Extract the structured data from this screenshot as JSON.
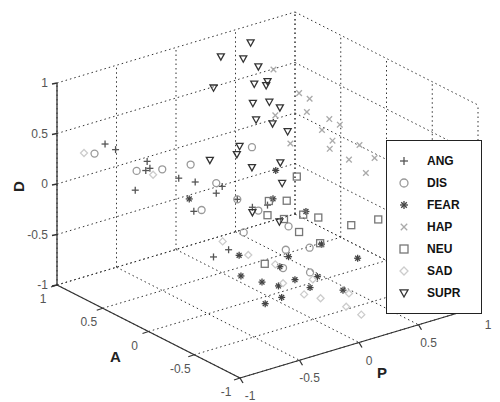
{
  "chart_data": {
    "type": "scatter",
    "dimensions": 3,
    "title": "",
    "xlabel": "P",
    "ylabel": "A",
    "zlabel": "D",
    "xlim": [
      -1,
      1
    ],
    "ylim": [
      -1,
      1
    ],
    "zlim": [
      -1,
      1
    ],
    "x_ticks": [
      "-1",
      "-0.5",
      "0",
      "0.5",
      "1"
    ],
    "y_ticks": [
      "1",
      "0.5",
      "0",
      "-0.5",
      "-1"
    ],
    "z_ticks": [
      "-1",
      "-0.5",
      "0",
      "0.5",
      "1"
    ],
    "grid": true,
    "legend_position": "right",
    "series": [
      {
        "name": "ANG",
        "marker": "plus",
        "color": "#555555",
        "points": [
          [
            -0.75,
            0.8,
            0.4
          ],
          [
            -0.7,
            0.75,
            0.35
          ],
          [
            -0.55,
            0.6,
            0.25
          ],
          [
            -0.6,
            0.55,
            0.2
          ],
          [
            -0.4,
            0.45,
            0.1
          ],
          [
            -0.3,
            0.4,
            0.05
          ],
          [
            -0.2,
            0.3,
            -0.05
          ],
          [
            -0.1,
            0.2,
            -0.1
          ],
          [
            -0.45,
            0.7,
            0.1
          ],
          [
            -0.65,
            0.6,
            0.0
          ],
          [
            -0.35,
            0.35,
            -0.2
          ],
          [
            -0.25,
            0.1,
            -0.5
          ],
          [
            -0.3,
            0.2,
            -0.6
          ],
          [
            -0.15,
            0.3,
            0.0
          ],
          [
            -0.05,
            0.1,
            -0.15
          ],
          [
            0.0,
            0.0,
            -0.1
          ]
        ]
      },
      {
        "name": "DIS",
        "marker": "circle",
        "color": "#999999",
        "points": [
          [
            -0.8,
            0.85,
            0.3
          ],
          [
            -0.6,
            0.65,
            0.15
          ],
          [
            -0.5,
            0.5,
            0.2
          ],
          [
            -0.3,
            0.45,
            0.2
          ],
          [
            -0.2,
            0.3,
            0.05
          ],
          [
            -0.1,
            0.2,
            -0.1
          ],
          [
            0.0,
            0.1,
            -0.2
          ],
          [
            0.1,
            -0.1,
            -0.3
          ],
          [
            -0.4,
            0.2,
            -0.1
          ],
          [
            -0.2,
            0.0,
            -0.3
          ],
          [
            0.0,
            -0.2,
            -0.45
          ],
          [
            0.2,
            -0.2,
            -0.5
          ],
          [
            -0.1,
            -0.3,
            -0.55
          ],
          [
            0.1,
            0.3,
            0.3
          ],
          [
            0.05,
            -0.4,
            -0.6
          ]
        ]
      },
      {
        "name": "FEAR",
        "marker": "star",
        "color": "#444444",
        "points": [
          [
            -0.3,
            -0.1,
            -0.65
          ],
          [
            -0.2,
            -0.2,
            -0.7
          ],
          [
            -0.1,
            -0.25,
            -0.75
          ],
          [
            -0.15,
            -0.35,
            -0.8
          ],
          [
            0.0,
            -0.3,
            -0.7
          ],
          [
            -0.25,
            -0.3,
            -0.85
          ],
          [
            -0.05,
            -0.2,
            -0.6
          ],
          [
            0.1,
            -0.1,
            -0.6
          ],
          [
            0.05,
            -0.4,
            -0.75
          ],
          [
            0.15,
            -0.35,
            -0.7
          ],
          [
            -0.2,
            0.05,
            -0.55
          ],
          [
            0.3,
            -0.2,
            -0.5
          ],
          [
            0.4,
            0.1,
            -0.35
          ],
          [
            0.2,
            0.2,
            -0.2
          ],
          [
            0.3,
            0.3,
            0.0
          ],
          [
            -0.35,
            0.4,
            -0.1
          ],
          [
            0.25,
            -0.5,
            -0.8
          ],
          [
            0.45,
            -0.4,
            -0.6
          ]
        ]
      },
      {
        "name": "HAP",
        "marker": "x",
        "color": "#aaaaaa",
        "points": [
          [
            0.55,
            0.65,
            0.75
          ],
          [
            0.65,
            0.5,
            0.55
          ],
          [
            0.7,
            0.45,
            0.5
          ],
          [
            0.6,
            0.35,
            0.45
          ],
          [
            0.75,
            0.3,
            0.35
          ],
          [
            0.8,
            0.25,
            0.3
          ],
          [
            0.7,
            0.2,
            0.2
          ],
          [
            0.85,
            0.1,
            0.15
          ],
          [
            0.65,
            0.25,
            0.3
          ],
          [
            0.6,
            0.1,
            0.2
          ],
          [
            0.9,
            0.0,
            0.05
          ],
          [
            0.75,
            -0.1,
            0.0
          ],
          [
            0.8,
            0.15,
            0.0
          ],
          [
            0.5,
            0.4,
            0.15
          ],
          [
            0.45,
            0.5,
            0.4
          ]
        ]
      },
      {
        "name": "NEU",
        "marker": "square",
        "color": "#777777",
        "points": [
          [
            0.0,
            0.0,
            -0.2
          ],
          [
            0.1,
            -0.05,
            -0.25
          ],
          [
            0.2,
            0.05,
            -0.15
          ],
          [
            0.15,
            -0.15,
            -0.35
          ],
          [
            0.3,
            0.0,
            -0.3
          ],
          [
            0.4,
            0.2,
            -0.05
          ],
          [
            0.35,
            -0.1,
            -0.3
          ],
          [
            0.55,
            -0.2,
            -0.4
          ],
          [
            0.7,
            -0.3,
            -0.35
          ],
          [
            0.25,
            -0.25,
            -0.45
          ],
          [
            -0.1,
            -0.1,
            -0.6
          ],
          [
            0.05,
            0.05,
            -0.1
          ]
        ]
      },
      {
        "name": "SAD",
        "marker": "diamond",
        "color": "#cccccc",
        "points": [
          [
            -0.85,
            0.9,
            0.3
          ],
          [
            -0.5,
            0.6,
            0.1
          ],
          [
            -0.3,
            0.1,
            -0.4
          ],
          [
            -0.2,
            -0.05,
            -0.5
          ],
          [
            -0.1,
            -0.3,
            -0.7
          ],
          [
            0.0,
            -0.4,
            -0.8
          ],
          [
            0.1,
            -0.45,
            -0.85
          ],
          [
            0.2,
            -0.6,
            -0.9
          ],
          [
            0.3,
            -0.5,
            -0.85
          ],
          [
            0.15,
            -0.3,
            -0.75
          ],
          [
            -0.05,
            -0.15,
            -0.6
          ],
          [
            0.25,
            -0.7,
            -0.95
          ]
        ]
      },
      {
        "name": "SUPR",
        "marker": "triangle-down",
        "color": "#333333",
        "points": [
          [
            0.3,
            0.9,
            0.85
          ],
          [
            0.45,
            0.85,
            0.8
          ],
          [
            0.35,
            0.6,
            0.7
          ],
          [
            0.45,
            0.6,
            0.65
          ],
          [
            0.5,
            0.65,
            0.65
          ],
          [
            0.3,
            0.55,
            0.55
          ],
          [
            0.4,
            0.5,
            0.55
          ],
          [
            0.45,
            0.45,
            0.5
          ],
          [
            0.25,
            0.45,
            0.45
          ],
          [
            0.35,
            0.4,
            0.4
          ],
          [
            0.4,
            0.3,
            0.35
          ],
          [
            0.5,
            0.75,
            0.75
          ],
          [
            0.55,
            0.9,
            0.9
          ],
          [
            0.2,
            0.85,
            0.6
          ],
          [
            0.15,
            0.5,
            0.2
          ],
          [
            0.1,
            0.3,
            0.1
          ],
          [
            0.2,
            0.1,
            0.0
          ],
          [
            0.05,
            0.4,
            0.2
          ],
          [
            0.3,
            0.25,
            0.1
          ],
          [
            -0.05,
            0.1,
            -0.2
          ],
          [
            0.1,
            0.0,
            -0.3
          ],
          [
            -0.1,
            0.5,
            0.15
          ]
        ]
      }
    ]
  },
  "axes": {
    "d_label": "D",
    "a_label": "A",
    "p_label": "P"
  },
  "legend": {
    "items": [
      {
        "label": "ANG",
        "marker": "plus"
      },
      {
        "label": "DIS",
        "marker": "circle"
      },
      {
        "label": "FEAR",
        "marker": "star"
      },
      {
        "label": "HAP",
        "marker": "x"
      },
      {
        "label": "NEU",
        "marker": "square"
      },
      {
        "label": "SAD",
        "marker": "diamond"
      },
      {
        "label": "SUPR",
        "marker": "triangle-down"
      }
    ]
  }
}
